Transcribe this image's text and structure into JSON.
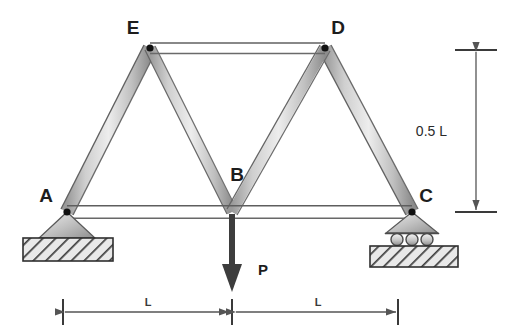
{
  "figure": {
    "type": "engineering-truss-free-body-diagram",
    "title": "",
    "background_color": "#ffffff"
  },
  "nodes": [
    {
      "id": "A",
      "label": "A",
      "x": 67,
      "y": 212,
      "label_x": 46,
      "label_y": 202,
      "support": "pin",
      "pin_dot": true
    },
    {
      "id": "B",
      "label": "B",
      "x": 232,
      "y": 212,
      "label_x": 237,
      "label_y": 181,
      "support": "none",
      "pin_dot": false
    },
    {
      "id": "C",
      "label": "C",
      "x": 412,
      "y": 212,
      "label_x": 426,
      "label_y": 202,
      "support": "roller",
      "pin_dot": true
    },
    {
      "id": "D",
      "label": "D",
      "x": 325,
      "y": 48,
      "label_x": 338,
      "label_y": 34,
      "support": "none",
      "pin_dot": true
    },
    {
      "id": "E",
      "label": "E",
      "x": 150,
      "y": 48,
      "label_x": 133,
      "label_y": 34,
      "support": "none",
      "pin_dot": true
    }
  ],
  "members": [
    {
      "name": "member-A-E",
      "from": "A",
      "to": "E"
    },
    {
      "name": "member-E-D",
      "from": "E",
      "to": "D"
    },
    {
      "name": "member-D-C",
      "from": "D",
      "to": "C"
    },
    {
      "name": "member-A-C",
      "from": "A",
      "to": "C"
    },
    {
      "name": "member-E-B",
      "from": "E",
      "to": "B"
    },
    {
      "name": "member-D-B",
      "from": "D",
      "to": "B"
    }
  ],
  "load": {
    "name": "point-load-P",
    "label": "P",
    "label_x": 263,
    "label_y": 275,
    "applied_at": "B",
    "direction": "down",
    "arrow_x": 232,
    "arrow_top_y": 214,
    "arrow_tip_y": 290,
    "color": "#3d3d3d"
  },
  "dimensions": {
    "vertical": {
      "name": "dimension-height",
      "label": "0.5 L",
      "label_x": 447,
      "label_y": 132,
      "line_x": 473,
      "top_y": 50,
      "bottom_y": 212,
      "tick_left": 455,
      "tick_right": 497
    },
    "horizontal": [
      {
        "name": "dimension-span-left",
        "label": "L",
        "label_x": 148,
        "label_y": 304,
        "from_x": 63,
        "to_x": 230,
        "y": 312
      },
      {
        "name": "dimension-span-right",
        "label": "L",
        "label_x": 318,
        "label_y": 304,
        "from_x": 235,
        "to_x": 398,
        "y": 312
      }
    ],
    "ticks_x": [
      63,
      232,
      398
    ],
    "tick_top_y": 298,
    "tick_bottom_y": 326
  },
  "supports": {
    "pin": {
      "name": "support-pin-A",
      "apex_x": 67,
      "apex_y": 212,
      "half_width": 28,
      "base_y": 238,
      "ground": {
        "x": 23,
        "y": 238,
        "width": 90,
        "height": 23
      }
    },
    "roller": {
      "name": "support-roller-C",
      "apex_x": 412,
      "apex_y": 212,
      "half_width": 26,
      "base_y": 233,
      "rollers": [
        {
          "cx": 397,
          "cy": 239
        },
        {
          "cx": 412,
          "cy": 239
        },
        {
          "cx": 427,
          "cy": 239
        }
      ],
      "roller_r": 6,
      "ground": {
        "x": 370,
        "y": 246,
        "width": 88,
        "height": 21
      }
    }
  },
  "colors": {
    "member_light": "#f2f2f2",
    "member_mid": "#c9c9c9",
    "member_dark": "#8e8e8e",
    "outline": "#555555",
    "pin_dot": "#111111",
    "hatch": "#4a4a4a",
    "ground_fill": "#e6e6e6",
    "dim_line": "#555555",
    "text": "#1d1d1d",
    "arrow": "#3d3d3d"
  }
}
